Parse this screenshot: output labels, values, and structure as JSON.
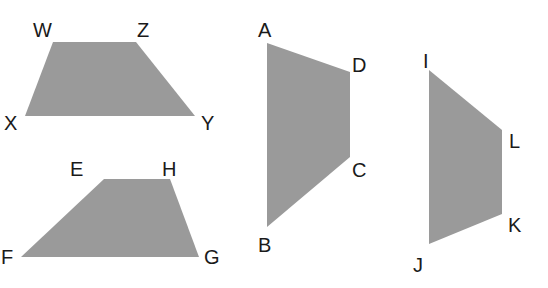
{
  "diagram": {
    "type": "geometry-figures",
    "fill_color": "#9a9a9a",
    "label_color": "#1a1a1a",
    "shapes": [
      {
        "name": "trapezoid-WZYX",
        "points": "53,42 136,42 195,116 25,116",
        "vertices": [
          {
            "label": "W",
            "x": 33,
            "y": 37
          },
          {
            "label": "Z",
            "x": 137,
            "y": 37
          },
          {
            "label": "Y",
            "x": 201,
            "y": 130
          },
          {
            "label": "X",
            "x": 4,
            "y": 130
          }
        ]
      },
      {
        "name": "trapezoid-EHGF",
        "points": "104,179 170,179 199,257 21,257",
        "vertices": [
          {
            "label": "E",
            "x": 70,
            "y": 176
          },
          {
            "label": "H",
            "x": 162,
            "y": 176
          },
          {
            "label": "G",
            "x": 204,
            "y": 264
          },
          {
            "label": "F",
            "x": 1,
            "y": 264
          }
        ]
      },
      {
        "name": "trapezoid-ADCB",
        "points": "267,43 350,72 350,157 267,227",
        "vertices": [
          {
            "label": "A",
            "x": 258,
            "y": 37
          },
          {
            "label": "D",
            "x": 352,
            "y": 72
          },
          {
            "label": "C",
            "x": 352,
            "y": 177
          },
          {
            "label": "B",
            "x": 258,
            "y": 252
          }
        ]
      },
      {
        "name": "trapezoid-ILKJ",
        "points": "429,70 502,130 502,214 429,244",
        "vertices": [
          {
            "label": "I",
            "x": 423,
            "y": 68
          },
          {
            "label": "L",
            "x": 509,
            "y": 148
          },
          {
            "label": "K",
            "x": 508,
            "y": 232
          },
          {
            "label": "J",
            "x": 413,
            "y": 272
          }
        ]
      }
    ]
  }
}
